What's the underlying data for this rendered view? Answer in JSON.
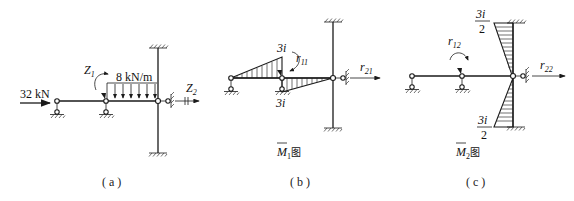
{
  "figure": {
    "panels": [
      {
        "id": "a",
        "caption": "( a )",
        "labels": {
          "horizontal_load": "32 kN",
          "distributed_load": "8 kN/m",
          "rotation_unknown": "Z",
          "rotation_unknown_sub": "1",
          "translation_unknown": "Z",
          "translation_unknown_sub": "2"
        }
      },
      {
        "id": "b",
        "caption": "( b )",
        "diagram_title": "M",
        "diagram_title_sub": "1",
        "diagram_title_suffix": "图",
        "labels": {
          "moment_top": "3i",
          "moment_bottom": "3i",
          "reaction_rot": "r",
          "reaction_rot_sub": "11",
          "reaction_trans": "r",
          "reaction_trans_sub": "21"
        }
      },
      {
        "id": "c",
        "caption": "( c )",
        "diagram_title": "M",
        "diagram_title_sub": "2",
        "diagram_title_suffix": "图",
        "labels": {
          "moment_top_num": "3i",
          "moment_top_den": "2",
          "moment_bottom_num": "3i",
          "moment_bottom_den": "2",
          "reaction_rot": "r",
          "reaction_rot_sub": "12",
          "reaction_trans": "r",
          "reaction_trans_sub": "22"
        }
      }
    ]
  }
}
